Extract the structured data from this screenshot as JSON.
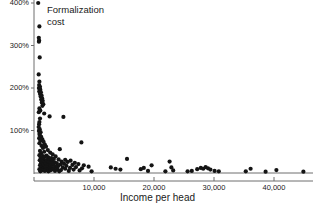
{
  "chart_data": {
    "type": "scatter",
    "title": "",
    "annotation": "Formalization\ncost",
    "xlabel": "Income per head",
    "ylabel": "",
    "xlim": [
      0,
      46500
    ],
    "ylim": [
      0,
      420
    ],
    "grid": false,
    "legend": null,
    "xticks": [
      10000,
      20000,
      30000,
      40000
    ],
    "xtick_labels": [
      "10,000",
      "20,000",
      "30,000",
      "40,000"
    ],
    "yticks": [
      100,
      200,
      300,
      400
    ],
    "ytick_labels": [
      "100%",
      "200%",
      "300%",
      "400%"
    ],
    "y_unit": "percent",
    "point_color": "#141414",
    "axis_color": "#6e6e6e",
    "points": [
      [
        700,
        400
      ],
      [
        900,
        345
      ],
      [
        800,
        318
      ],
      [
        850,
        312
      ],
      [
        820,
        309
      ],
      [
        950,
        272
      ],
      [
        780,
        232
      ],
      [
        900,
        215
      ],
      [
        860,
        207
      ],
      [
        1000,
        203
      ],
      [
        820,
        200
      ],
      [
        930,
        198
      ],
      [
        1050,
        196
      ],
      [
        880,
        192
      ],
      [
        1150,
        190
      ],
      [
        1000,
        186
      ],
      [
        1250,
        183
      ],
      [
        1100,
        180
      ],
      [
        1350,
        176
      ],
      [
        1200,
        173
      ],
      [
        1450,
        170
      ],
      [
        1300,
        166
      ],
      [
        1550,
        162
      ],
      [
        1400,
        158
      ],
      [
        900,
        152
      ],
      [
        1050,
        147
      ],
      [
        800,
        143
      ],
      [
        1700,
        140
      ],
      [
        2600,
        133
      ],
      [
        4900,
        132
      ],
      [
        1000,
        128
      ],
      [
        900,
        120
      ],
      [
        850,
        115
      ],
      [
        780,
        108
      ],
      [
        950,
        103
      ],
      [
        820,
        99
      ],
      [
        1100,
        96
      ],
      [
        900,
        92
      ],
      [
        1000,
        88
      ],
      [
        1200,
        85
      ],
      [
        860,
        82
      ],
      [
        1400,
        79
      ],
      [
        1050,
        76
      ],
      [
        1600,
        73
      ],
      [
        7900,
        72
      ],
      [
        900,
        70
      ],
      [
        1800,
        67
      ],
      [
        1250,
        64
      ],
      [
        2000,
        62
      ],
      [
        1500,
        59
      ],
      [
        4300,
        56
      ],
      [
        2300,
        54
      ],
      [
        1000,
        52
      ],
      [
        1700,
        50
      ],
      [
        2700,
        48
      ],
      [
        1200,
        46
      ],
      [
        3100,
        44
      ],
      [
        900,
        42
      ],
      [
        2100,
        41
      ],
      [
        1500,
        40
      ],
      [
        3600,
        39
      ],
      [
        1800,
        38
      ],
      [
        2400,
        37
      ],
      [
        1100,
        36
      ],
      [
        2900,
        35
      ],
      [
        1350,
        34
      ],
      [
        3300,
        33
      ],
      [
        1600,
        32
      ],
      [
        4100,
        32
      ],
      [
        5200,
        31
      ],
      [
        2200,
        31
      ],
      [
        950,
        30
      ],
      [
        2600,
        30
      ],
      [
        6100,
        29
      ],
      [
        1750,
        29
      ],
      [
        3000,
        28
      ],
      [
        1250,
        28
      ],
      [
        4600,
        27
      ],
      [
        2050,
        27
      ],
      [
        5600,
        26
      ],
      [
        1450,
        26
      ],
      [
        3400,
        25
      ],
      [
        2400,
        25
      ],
      [
        6800,
        24
      ],
      [
        1650,
        24
      ],
      [
        3800,
        23
      ],
      [
        1150,
        23
      ],
      [
        2800,
        22
      ],
      [
        5000,
        22
      ],
      [
        7400,
        21
      ],
      [
        1900,
        21
      ],
      [
        4400,
        20
      ],
      [
        1350,
        20
      ],
      [
        3200,
        19
      ],
      [
        6400,
        19
      ],
      [
        2300,
        18
      ],
      [
        8300,
        18
      ],
      [
        1000,
        18
      ],
      [
        5400,
        17
      ],
      [
        2700,
        17
      ],
      [
        4000,
        16
      ],
      [
        1550,
        16
      ],
      [
        9100,
        15
      ],
      [
        3600,
        15
      ],
      [
        7000,
        14
      ],
      [
        2100,
        14
      ],
      [
        1200,
        13
      ],
      [
        4800,
        13
      ],
      [
        6000,
        12
      ],
      [
        2900,
        12
      ],
      [
        1700,
        12
      ],
      [
        3300,
        11
      ],
      [
        8000,
        11
      ],
      [
        1400,
        10
      ],
      [
        5200,
        10
      ],
      [
        2500,
        10
      ],
      [
        900,
        9
      ],
      [
        3900,
        9
      ],
      [
        1900,
        9
      ],
      [
        6600,
        8
      ],
      [
        1100,
        8
      ],
      [
        3000,
        8
      ],
      [
        4500,
        7
      ],
      [
        2200,
        7
      ],
      [
        1500,
        7
      ],
      [
        7600,
        6
      ],
      [
        2700,
        6
      ],
      [
        1300,
        6
      ],
      [
        5800,
        5
      ],
      [
        3500,
        5
      ],
      [
        1800,
        5
      ],
      [
        9600,
        4
      ],
      [
        2400,
        4
      ],
      [
        4200,
        4
      ],
      [
        1050,
        4
      ],
      [
        12800,
        13
      ],
      [
        13600,
        10
      ],
      [
        14400,
        8
      ],
      [
        15500,
        33
      ],
      [
        17800,
        9
      ],
      [
        18300,
        12
      ],
      [
        19000,
        5
      ],
      [
        19600,
        18
      ],
      [
        21900,
        4
      ],
      [
        22600,
        27
      ],
      [
        22900,
        13
      ],
      [
        23200,
        6
      ],
      [
        25600,
        4
      ],
      [
        26300,
        5
      ],
      [
        27200,
        9
      ],
      [
        27800,
        12
      ],
      [
        28200,
        10
      ],
      [
        28600,
        14
      ],
      [
        29000,
        11
      ],
      [
        29400,
        8
      ],
      [
        30100,
        5
      ],
      [
        30800,
        4
      ],
      [
        35300,
        4
      ],
      [
        36100,
        10
      ],
      [
        38600,
        3
      ],
      [
        40400,
        7
      ],
      [
        44900,
        3
      ]
    ],
    "geometry": {
      "axis_x_px": 34,
      "axis_y_px": 173,
      "x_px_per_10000": 60,
      "y_px_per_100pct": 42.5,
      "dot_radius_px": 2.1
    }
  }
}
